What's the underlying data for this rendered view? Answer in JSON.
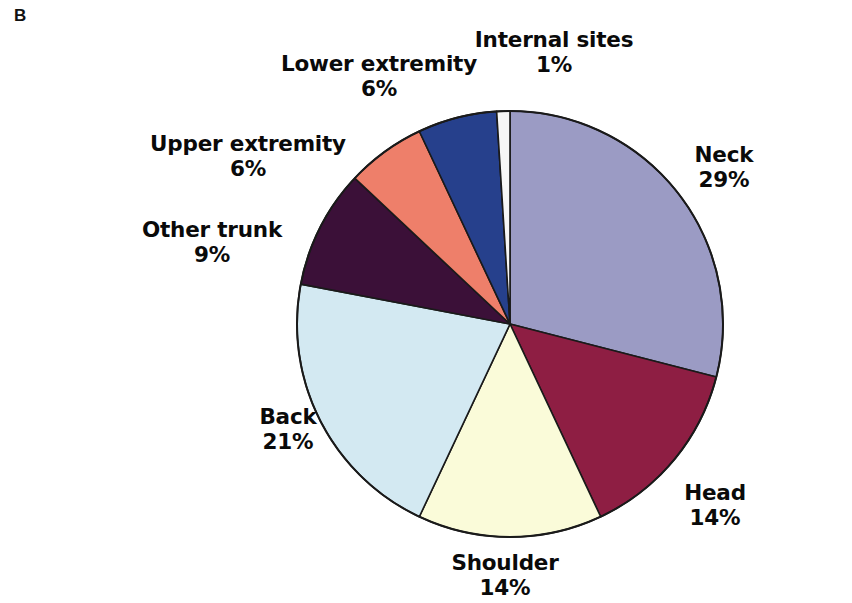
{
  "figure": {
    "panel_letter": "B",
    "background_color": "#ffffff"
  },
  "chart_data": {
    "type": "pie",
    "title": "",
    "xlabel": "",
    "ylabel": "",
    "legend_position": "none",
    "grid": false,
    "units": "percent",
    "start_angle_deg": 0,
    "direction": "clockwise",
    "categories": [
      "Neck",
      "Head",
      "Shoulder",
      "Back",
      "Other trunk",
      "Upper extremity",
      "Lower extremity",
      "Internal sites"
    ],
    "values": [
      29,
      14,
      14,
      21,
      9,
      6,
      6,
      1
    ],
    "value_labels": [
      "29%",
      "14%",
      "14%",
      "21%",
      "9%",
      "6%",
      "6%",
      "1%"
    ],
    "colors": [
      "#9b9bc4",
      "#8e1e43",
      "#fafbd9",
      "#d3e9f2",
      "#3b1038",
      "#ee7f6a",
      "#26408c",
      "#f7f7f7"
    ],
    "slice_outline_color": "#1a1a1a",
    "slices": [
      {
        "label": "Neck",
        "value": 29,
        "value_label": "29%",
        "color": "#9b9bc4"
      },
      {
        "label": "Head",
        "value": 14,
        "value_label": "14%",
        "color": "#8e1e43"
      },
      {
        "label": "Shoulder",
        "value": 14,
        "value_label": "14%",
        "color": "#fafbd9"
      },
      {
        "label": "Back",
        "value": 21,
        "value_label": "21%",
        "color": "#d3e9f2"
      },
      {
        "label": "Other trunk",
        "value": 9,
        "value_label": "9%",
        "color": "#3b1038"
      },
      {
        "label": "Upper extremity",
        "value": 6,
        "value_label": "6%",
        "color": "#ee7f6a"
      },
      {
        "label": "Lower extremity",
        "value": 6,
        "value_label": "6%",
        "color": "#26408c"
      },
      {
        "label": "Internal sites",
        "value": 1,
        "value_label": "1%",
        "color": "#f7f7f7"
      }
    ]
  }
}
